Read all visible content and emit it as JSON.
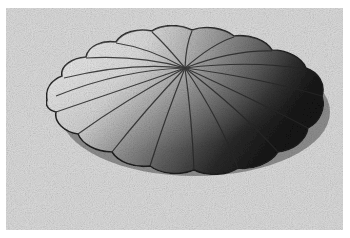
{
  "image": {
    "subject": "scalloped dome (sand-dollar / urchin-like) relief",
    "style": "grainy stippled grayscale illustration",
    "background_color": "#d9d9d9",
    "border_color": "#ffffff",
    "dome": {
      "center": [
        185,
        100
      ],
      "apex": [
        185,
        68
      ],
      "rx": 137,
      "ry": 72,
      "lobes": 18,
      "light_tone": "#eeeeee",
      "dark_tone": "#1a1a1a"
    }
  }
}
